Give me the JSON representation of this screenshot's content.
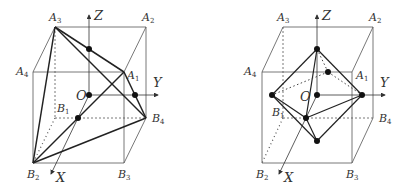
{
  "figures": [
    {
      "id": "left",
      "title": "Tetrahedron inscribed in cube",
      "labels": {
        "A1": {
          "base": "A",
          "sub": "1"
        },
        "A2": {
          "base": "A",
          "sub": "2"
        },
        "A3": {
          "base": "A",
          "sub": "3"
        },
        "A4": {
          "base": "A",
          "sub": "4"
        },
        "B1": {
          "base": "B",
          "sub": "1"
        },
        "B2": {
          "base": "B",
          "sub": "2"
        },
        "B3": {
          "base": "B",
          "sub": "3"
        },
        "B4": {
          "base": "B",
          "sub": "4"
        },
        "O": "O",
        "X": "X",
        "Y": "Y",
        "Z": "Z"
      }
    },
    {
      "id": "right",
      "title": "Octahedron inscribed in cube",
      "labels": {
        "A1": {
          "base": "A",
          "sub": "1"
        },
        "A2": {
          "base": "A",
          "sub": "2"
        },
        "A3": {
          "base": "A",
          "sub": "3"
        },
        "A4": {
          "base": "A",
          "sub": "4"
        },
        "B1": {
          "base": "B",
          "sub": "1"
        },
        "B2": {
          "base": "B",
          "sub": "2"
        },
        "B3": {
          "base": "B",
          "sub": "3"
        },
        "B4": {
          "base": "B",
          "sub": "4"
        },
        "O": "O",
        "X": "X",
        "Y": "Y",
        "Z": "Z"
      }
    }
  ],
  "colors": {
    "thin_line": "#555555",
    "thick_line": "#222222",
    "dot": "#111111",
    "label": "#333333"
  }
}
